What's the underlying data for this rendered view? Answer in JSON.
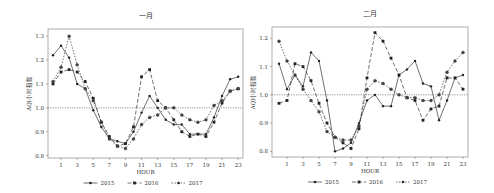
{
  "chart_data": [
    {
      "type": "line",
      "title": "一月",
      "xlabel": "HOUR",
      "ylabel": "AQI小时指数",
      "x": [
        0,
        1,
        2,
        3,
        4,
        5,
        6,
        7,
        8,
        9,
        10,
        11,
        12,
        13,
        14,
        15,
        16,
        17,
        18,
        19,
        20,
        21,
        22,
        23
      ],
      "xticks": [
        1,
        3,
        5,
        7,
        9,
        11,
        13,
        15,
        17,
        19,
        21,
        23
      ],
      "yticks": [
        0.8,
        0.9,
        1.0,
        1.1,
        1.2,
        1.3
      ],
      "ylim": [
        0.79,
        1.33
      ],
      "reference_line": 1.0,
      "grid": false,
      "legend_position": "bottom",
      "series": [
        {
          "name": "2015",
          "style": "solid",
          "marker": "circle",
          "values": [
            1.22,
            1.26,
            1.21,
            1.1,
            1.08,
            0.99,
            0.92,
            0.87,
            0.86,
            0.85,
            0.9,
            0.98,
            1.05,
            1.0,
            0.95,
            0.93,
            0.93,
            0.89,
            0.89,
            0.89,
            0.96,
            1.05,
            1.12,
            1.13
          ]
        },
        {
          "name": "2016",
          "style": "dashed",
          "marker": "square",
          "values": [
            1.1,
            1.15,
            1.16,
            1.15,
            1.11,
            1.04,
            0.94,
            0.88,
            0.84,
            0.85,
            0.92,
            1.13,
            1.16,
            1.03,
            1.0,
            0.95,
            0.9,
            0.88,
            0.89,
            0.88,
            0.94,
            1.02,
            1.07,
            1.08
          ]
        },
        {
          "name": "2017",
          "style": "dotted",
          "marker": "star",
          "values": [
            1.11,
            1.17,
            1.3,
            1.18,
            1.08,
            1.03,
            0.94,
            0.87,
            0.84,
            0.83,
            0.87,
            0.93,
            0.96,
            0.97,
            1.0,
            1.0,
            0.97,
            0.95,
            0.94,
            0.95,
            1.01,
            1.03,
            1.07,
            1.08
          ]
        }
      ]
    },
    {
      "type": "line",
      "title": "二月",
      "xlabel": "HOUR",
      "ylabel": "AQI小时指数",
      "x": [
        0,
        1,
        2,
        3,
        4,
        5,
        6,
        7,
        8,
        9,
        10,
        11,
        12,
        13,
        14,
        15,
        16,
        17,
        18,
        19,
        20,
        21,
        22,
        23
      ],
      "xticks": [
        1,
        3,
        5,
        7,
        9,
        11,
        13,
        15,
        17,
        19,
        21,
        23
      ],
      "yticks": [
        0.8,
        0.9,
        1.0,
        1.1,
        1.2
      ],
      "ylim": [
        0.78,
        1.24
      ],
      "reference_line": 1.0,
      "grid": false,
      "legend_position": "bottom",
      "series": [
        {
          "name": "2015",
          "style": "solid",
          "marker": "circle",
          "values": [
            1.11,
            1.02,
            1.07,
            1.03,
            1.15,
            1.12,
            0.98,
            0.8,
            0.81,
            0.83,
            0.9,
            0.98,
            1.0,
            0.96,
            0.96,
            1.07,
            1.09,
            1.12,
            1.04,
            1.03,
            0.91,
            0.98,
            1.06,
            1.07
          ]
        },
        {
          "name": "2016",
          "style": "dashed",
          "marker": "square",
          "values": [
            0.97,
            0.98,
            1.11,
            1.1,
            1.05,
            0.97,
            0.9,
            0.85,
            0.83,
            0.81,
            0.88,
            1.06,
            1.22,
            1.19,
            1.13,
            1.07,
            0.99,
            0.98,
            0.91,
            0.95,
            0.96,
            1.06,
            1.06,
            1.02
          ]
        },
        {
          "name": "2017",
          "style": "dotted",
          "marker": "star",
          "values": [
            1.19,
            1.12,
            1.07,
            1.02,
            0.98,
            0.94,
            0.87,
            0.85,
            0.84,
            0.84,
            0.89,
            1.02,
            1.05,
            1.04,
            1.02,
            1.0,
            0.99,
            0.99,
            0.98,
            0.98,
            1.0,
            1.08,
            1.12,
            1.15
          ]
        }
      ]
    }
  ],
  "charts_layout": [
    {
      "left": 0,
      "frame": {
        "x": 48,
        "y": 29,
        "w": 195,
        "h": 129
      },
      "x0": 53,
      "xstep": 8.05,
      "title_y": 18
    },
    {
      "left": 0,
      "frame": {
        "x": 272,
        "y": 27,
        "w": 196,
        "h": 130
      },
      "x0": 279,
      "xstep": 8.0,
      "title_y": 16
    }
  ]
}
